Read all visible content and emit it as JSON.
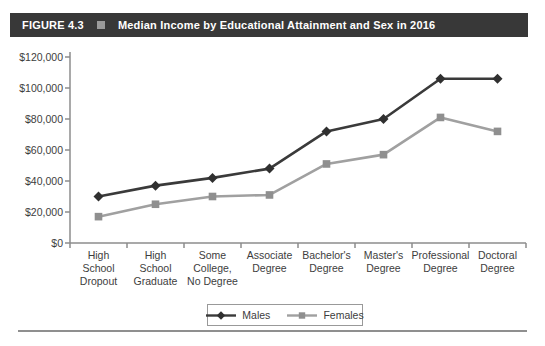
{
  "header": {
    "label": "FIGURE 4.3",
    "title": "Median Income by Educational Attainment and Sex in 2016",
    "bar_color": "#383838",
    "bullet_color": "#9a9a9a"
  },
  "chart_data": {
    "type": "line",
    "title": "Median Income by Educational Attainment and Sex in 2016",
    "categories": [
      "High School Dropout",
      "High School Graduate",
      "Some College, No Degree",
      "Associate Degree",
      "Bachelor's Degree",
      "Master's Degree",
      "Professional Degree",
      "Doctoral Degree"
    ],
    "series": [
      {
        "name": "Males",
        "marker": "diamond",
        "color": "#3a3a3a",
        "marker_color": "#303030",
        "values": [
          30000,
          37000,
          42000,
          48000,
          72000,
          80000,
          106000,
          106000
        ]
      },
      {
        "name": "Females",
        "marker": "square",
        "color": "#a0a0a0",
        "marker_color": "#8f8f8f",
        "values": [
          17000,
          25000,
          30000,
          31000,
          51000,
          57000,
          81000,
          72000
        ]
      }
    ],
    "ylim": [
      0,
      120000
    ],
    "ytick_step": 20000,
    "ytick_labels": [
      "$0",
      "$20,000",
      "$40,000",
      "$60,000",
      "$80,000",
      "$100,000",
      "$120,000"
    ],
    "xlabel": "",
    "ylabel": "",
    "grid": false,
    "legend_position": "bottom-center",
    "axis_color": "#8c8c8c",
    "text_color": "#3d3d3d",
    "divider_color": "#8f8f8f"
  }
}
